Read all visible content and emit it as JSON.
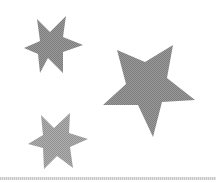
{
  "image": {
    "background": "#ffffff",
    "shapes": [
      {
        "type": "star",
        "points": 6,
        "label": "six-point star (top left)",
        "color": "#8f8f8f"
      },
      {
        "type": "star",
        "points": 5,
        "label": "five-point star (right)",
        "color": "#8f8f8f"
      },
      {
        "type": "star",
        "points": 6,
        "label": "six-point star (bottom left)",
        "color": "#a3a3a3"
      }
    ],
    "divider_color": "#cccccc"
  }
}
